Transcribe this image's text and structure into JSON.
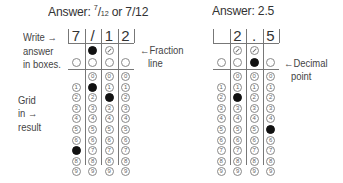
{
  "left": {
    "title_prefix": "Answer: ",
    "title_frac_num": "7",
    "title_frac_den": "12",
    "title_suffix": " or 7/12",
    "boxes": [
      "7",
      "/",
      "1",
      "2"
    ],
    "labels": {
      "write": "Write →",
      "answer": "answer",
      "in_boxes": "in boxes.",
      "grid": "Grid",
      "in": "in →",
      "result": "result",
      "fraction": "←Fraction",
      "line": "line"
    },
    "filled": {
      "slash": [
        1
      ],
      "decimal": [],
      "digits": {
        "0": 7,
        "1": 1,
        "2": 2
      }
    },
    "slash_cols": [
      1,
      2
    ],
    "decimal_cols": [
      0,
      1,
      2,
      3
    ],
    "zero_cols": [
      1,
      2,
      3
    ]
  },
  "right": {
    "title": "Answer: 2.5",
    "boxes": [
      "",
      "2",
      ".",
      "5"
    ],
    "labels": {
      "decimal": "←Decimal",
      "point": "point"
    },
    "filled": {
      "slash": [],
      "decimal": [
        2
      ],
      "digits": {
        "1": 2,
        "3": 5
      }
    },
    "slash_cols": [
      1,
      2
    ],
    "decimal_cols": [
      0,
      1,
      2,
      3
    ],
    "zero_cols": [
      1,
      2,
      3
    ]
  },
  "digits": [
    "0",
    "1",
    "2",
    "3",
    "4",
    "5",
    "6",
    "7",
    "8",
    "9"
  ]
}
